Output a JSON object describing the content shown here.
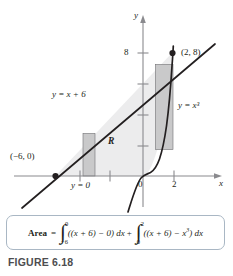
{
  "figure": {
    "caption": "FIGURE 6.18",
    "colors": {
      "curve": "#231f20",
      "axis": "#8a8a8e",
      "region_fill": "#ececed",
      "rect_fill": "#c9c9ca",
      "box_border": "#a9b7c4",
      "caption_color": "#4d4d4f"
    }
  },
  "graph": {
    "axes": {
      "y_label": "y",
      "x_label": "x",
      "origin_label": "0"
    },
    "ticks": {
      "y": [
        {
          "label": "8",
          "value": 8
        },
        {
          "label": "",
          "value": 6
        },
        {
          "label": "",
          "value": 4
        },
        {
          "label": "",
          "value": 2
        }
      ],
      "x": [
        {
          "label": "",
          "value": -4
        },
        {
          "label": "",
          "value": -2
        },
        {
          "label": "2",
          "value": 2
        }
      ]
    },
    "curves": [
      {
        "name": "line",
        "label": "y = x + 6",
        "equation": "y = x + 6"
      },
      {
        "name": "cubic",
        "label": "y = x³",
        "equation": "y = x^3"
      },
      {
        "name": "x-axis-boundary",
        "label": "y = 0",
        "equation": "y = 0"
      }
    ],
    "points": [
      {
        "label": "(2, 8)",
        "x": 2,
        "y": 8
      },
      {
        "label": "(−6, 0)",
        "x": -6,
        "y": 0
      }
    ],
    "region": {
      "label": "R",
      "description": "region bounded by y = x + 6, y = 0 and y = x³"
    },
    "rect_slices": [
      {
        "name": "left-slice",
        "x_from": -3.2,
        "x_to": -2.2
      },
      {
        "name": "right-slice",
        "x_from": 0.95,
        "x_to": 1.6
      }
    ]
  },
  "equation": {
    "lhs": "Area",
    "equals": "=",
    "plus": "+",
    "integral1": {
      "lower": "−6",
      "upper": "0",
      "body": "((x + 6) − 0) dx"
    },
    "integral2": {
      "lower": "0",
      "upper": "2",
      "body_pre": "((x + 6) − x",
      "body_sup": "3",
      "body_post": ") dx"
    }
  }
}
